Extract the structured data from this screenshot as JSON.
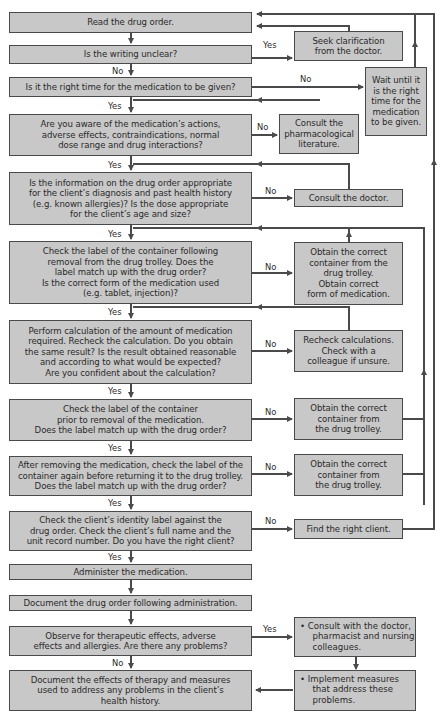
{
  "flowchart": {
    "main_steps": [
      {
        "id": "read",
        "text": "Read the drug order."
      },
      {
        "id": "writing",
        "text": "Is the writing unclear?"
      },
      {
        "id": "time",
        "text": "Is it the right time for the medication to be given?"
      },
      {
        "id": "aware",
        "text": "Are you aware of the medication’s actions,\nadverse effects, contraindications, normal\ndose range and drug interactions?"
      },
      {
        "id": "info",
        "text": "Is the information on the drug order appropriate\nfor the client’s diagnosis and past health history\n(e.g. known allergies)? Is the dose appropriate\nfor the client’s age and size?"
      },
      {
        "id": "label1",
        "text": "Check the label of the container following\nremoval from the drug trolley. Does the\nlabel match up with the drug order?\nIs the correct form of the medication used\n(e.g. tablet, injection)?"
      },
      {
        "id": "calc",
        "text": "Perform calculation of the amount of medication\nrequired. Recheck the calculation. Do you obtain\nthe same result? Is the result obtained reasonable\nand according to what would be expected?\nAre you confident about the calculation?"
      },
      {
        "id": "label2",
        "text": "Check the label of the container\nprior to removal of the medication.\nDoes the label match up with the drug order?"
      },
      {
        "id": "label3",
        "text": "After removing the medication, check the label of the\ncontainer again before returning it to the drug trolley.\nDoes the label match up with the drug order?"
      },
      {
        "id": "identity",
        "text": "Check the client’s identity label against the\ndrug order. Check the client’s full name and the\nunit record number. Do you have the right client?"
      },
      {
        "id": "administer",
        "text": "Administer the medication."
      },
      {
        "id": "document_order",
        "text": "Document the drug order following administration."
      },
      {
        "id": "observe",
        "text": "Observe for therapeutic effects, adverse\neffects and allergies. Are there any problems?"
      },
      {
        "id": "document_effects",
        "text": "Document the effects of therapy and measures\nused to address any problems in the client’s\nhealth history."
      }
    ],
    "side_steps": [
      {
        "id": "seek",
        "text": "Seek clarification\nfrom the doctor."
      },
      {
        "id": "wait",
        "text": "Wait until it\nis the right\ntime for the\nmedication\nto be given."
      },
      {
        "id": "pharm",
        "text": "Consult the\npharmacological\nliterature."
      },
      {
        "id": "consult_doctor",
        "text": "Consult the doctor."
      },
      {
        "id": "obtain1",
        "text": "Obtain the correct\ncontainer from the\ndrug trolley.\nObtain correct\nform of medication."
      },
      {
        "id": "recheck",
        "text": "Recheck calculations.\nCheck with a\ncolleague if unsure."
      },
      {
        "id": "obtain2",
        "text": "Obtain the correct\ncontainer from\nthe drug trolley."
      },
      {
        "id": "obtain3",
        "text": "Obtain the correct\ncontainer from\nthe drug trolley."
      },
      {
        "id": "find_client",
        "text": "Find the right client."
      },
      {
        "id": "consult_team",
        "text": "• Consult with the doctor,\n  pharmacist and nursing\n  colleagues."
      },
      {
        "id": "implement",
        "text": "• Implement measures\n  that address these\n  problems."
      }
    ],
    "edge_labels": {
      "yes": "Yes",
      "no": "No"
    },
    "colors": {
      "box_fill": "#c8c8c8",
      "line": "#4a4a4a",
      "text": "#2a2a2a"
    }
  }
}
